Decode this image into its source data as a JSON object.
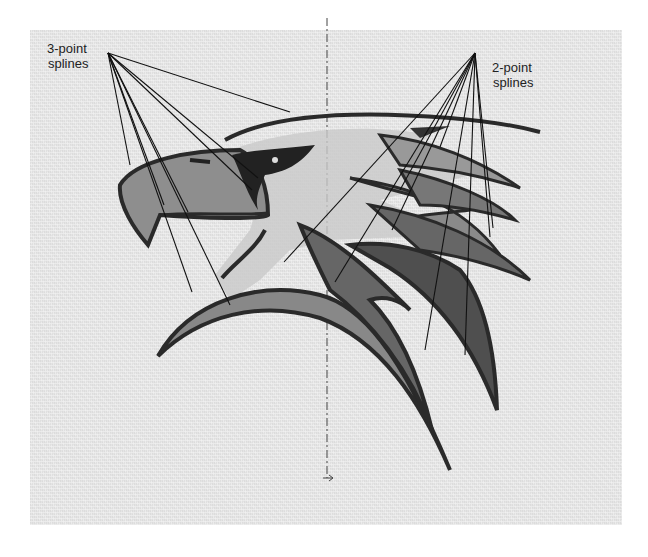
{
  "figure": {
    "labels": {
      "three_point": {
        "line1": "3-point",
        "line2": "splines"
      },
      "two_point": {
        "line1": "2-point",
        "line2": "splines"
      }
    },
    "colors": {
      "background": "#e4e4e4",
      "outline": "#2a2a2a",
      "fill_light": "#b5b5b5",
      "fill_mid": "#8e8e8e",
      "fill_dark": "#555555",
      "leader": "#111111"
    }
  }
}
